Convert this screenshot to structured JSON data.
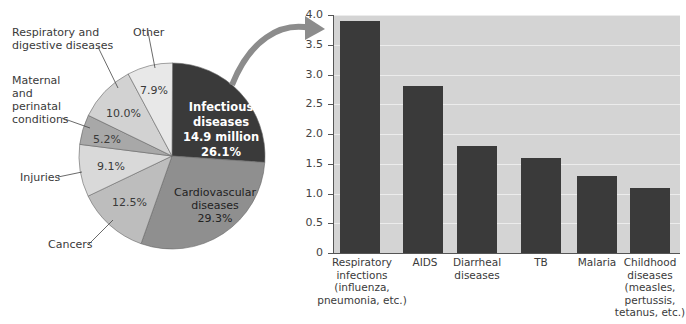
{
  "chart_data": [
    {
      "type": "pie",
      "title": "",
      "slices": [
        {
          "label": "Infectious diseases",
          "detail": "14.9 million",
          "value": 26.1,
          "pct_label": "26.1%",
          "color": "#3a3a3a"
        },
        {
          "label": "Cardiovascular diseases",
          "value": 29.3,
          "pct_label": "29.3%",
          "color": "#8f8f8f"
        },
        {
          "label": "Cancers",
          "value": 12.5,
          "pct_label": "12.5%",
          "color": "#bdbdbd"
        },
        {
          "label": "Injuries",
          "value": 9.1,
          "pct_label": "9.1%",
          "color": "#d9d9d9"
        },
        {
          "label": "Maternal and perinatal conditions",
          "value": 5.2,
          "pct_label": "5.2%",
          "color": "#a8a8a8"
        },
        {
          "label": "Respiratory and digestive diseases",
          "value": 10.0,
          "pct_label": "10.0%",
          "color": "#d2d2d2"
        },
        {
          "label": "Other",
          "value": 7.9,
          "pct_label": "7.9%",
          "color": "#e8e8e8"
        }
      ]
    },
    {
      "type": "bar",
      "title": "",
      "xlabel": "",
      "ylabel": "Annual deaths (millions)",
      "ylim": [
        0,
        4.0
      ],
      "yticks": [
        "0",
        "0.5",
        "1.0",
        "1.5",
        "2.0",
        "2.5",
        "3.0",
        "3.5",
        "4.0"
      ],
      "grid": true,
      "categories": [
        "Respiratory infections (influenza, pneumonia, etc.)",
        "AIDS",
        "Diarrheal diseases",
        "TB",
        "Malaria",
        "Childhood diseases (measles, pertussis, tetanus, etc.)"
      ],
      "values": [
        3.9,
        2.8,
        1.8,
        1.6,
        1.3,
        1.1
      ],
      "bar_color": "#3a3a3a",
      "background": "#d4d4d4"
    }
  ],
  "pie": {
    "labels": {
      "resp_dig_1": "Respiratory and",
      "resp_dig_2": "digestive diseases",
      "other": "Other",
      "maternal_1": "Maternal",
      "maternal_2": "and",
      "maternal_3": "perinatal",
      "maternal_4": "conditions",
      "injuries": "Injuries",
      "cancers": "Cancers"
    },
    "inner": {
      "other_pct": "7.9%",
      "resp_pct": "10.0%",
      "maternal_pct": "5.2%",
      "injuries_pct": "9.1%",
      "cancers_pct": "12.5%",
      "inf_1": "Infectious",
      "inf_2": "diseases",
      "inf_3": "14.9 million",
      "inf_4": "26.1%",
      "cardio_1": "Cardiovascular",
      "cardio_2": "diseases",
      "cardio_3": "29.3%"
    }
  },
  "bar": {
    "ylabel": "Annual deaths (millions)",
    "ticks": [
      "0",
      "0.5",
      "1.0",
      "1.5",
      "2.0",
      "2.5",
      "3.0",
      "3.5",
      "4.0"
    ],
    "cats": [
      [
        "Respiratory",
        "infections",
        "(influenza,",
        "pneumonia, etc.)"
      ],
      [
        "AIDS"
      ],
      [
        "Diarrheal",
        "diseases"
      ],
      [
        "TB"
      ],
      [
        "Malaria"
      ],
      [
        "Childhood",
        "diseases",
        "(measles,",
        "pertussis,",
        "tetanus, etc.)"
      ]
    ]
  }
}
